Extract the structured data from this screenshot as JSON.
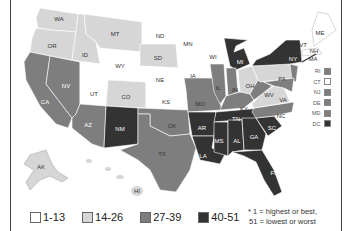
{
  "map": {
    "title": "",
    "colors": {
      "1-13": "#ffffff",
      "14-26": "#d6d6d6",
      "27-39": "#7e7e7e",
      "40-51": "#333333"
    },
    "states": [
      {
        "abbr": "WA",
        "tier": "14-26"
      },
      {
        "abbr": "OR",
        "tier": "14-26"
      },
      {
        "abbr": "CA",
        "tier": "27-39"
      },
      {
        "abbr": "ID",
        "tier": "14-26"
      },
      {
        "abbr": "NV",
        "tier": "27-39"
      },
      {
        "abbr": "MT",
        "tier": "14-26"
      },
      {
        "abbr": "WY",
        "tier": "1-13"
      },
      {
        "abbr": "UT",
        "tier": "1-13"
      },
      {
        "abbr": "AZ",
        "tier": "27-39"
      },
      {
        "abbr": "CO",
        "tier": "14-26"
      },
      {
        "abbr": "NM",
        "tier": "40-51"
      },
      {
        "abbr": "ND",
        "tier": "1-13"
      },
      {
        "abbr": "SD",
        "tier": "14-26"
      },
      {
        "abbr": "NE",
        "tier": "1-13"
      },
      {
        "abbr": "KS",
        "tier": "1-13"
      },
      {
        "abbr": "OK",
        "tier": "27-39"
      },
      {
        "abbr": "TX",
        "tier": "27-39"
      },
      {
        "abbr": "MN",
        "tier": "1-13"
      },
      {
        "abbr": "IA",
        "tier": "1-13"
      },
      {
        "abbr": "MO",
        "tier": "27-39"
      },
      {
        "abbr": "AR",
        "tier": "40-51"
      },
      {
        "abbr": "LA",
        "tier": "40-51"
      },
      {
        "abbr": "WI",
        "tier": "1-13"
      },
      {
        "abbr": "IL",
        "tier": "27-39"
      },
      {
        "abbr": "MI",
        "tier": "40-51"
      },
      {
        "abbr": "IN",
        "tier": "27-39"
      },
      {
        "abbr": "OH",
        "tier": "14-26"
      },
      {
        "abbr": "KY",
        "tier": "27-39"
      },
      {
        "abbr": "TN",
        "tier": "40-51"
      },
      {
        "abbr": "MS",
        "tier": "40-51"
      },
      {
        "abbr": "AL",
        "tier": "40-51"
      },
      {
        "abbr": "GA",
        "tier": "40-51"
      },
      {
        "abbr": "FL",
        "tier": "40-51"
      },
      {
        "abbr": "SC",
        "tier": "40-51"
      },
      {
        "abbr": "NC",
        "tier": "27-39"
      },
      {
        "abbr": "VA",
        "tier": "14-26"
      },
      {
        "abbr": "WV",
        "tier": "27-39"
      },
      {
        "abbr": "PA",
        "tier": "14-26"
      },
      {
        "abbr": "NY",
        "tier": "40-51"
      },
      {
        "abbr": "VT",
        "tier": "1-13"
      },
      {
        "abbr": "NH",
        "tier": "1-13"
      },
      {
        "abbr": "ME",
        "tier": "1-13"
      },
      {
        "abbr": "MA",
        "tier": "1-13"
      },
      {
        "abbr": "AK",
        "tier": "14-26"
      },
      {
        "abbr": "HI",
        "tier": "14-26"
      }
    ],
    "small_states": [
      {
        "abbr": "RI",
        "tier": "27-39"
      },
      {
        "abbr": "CT",
        "tier": "1-13"
      },
      {
        "abbr": "NJ",
        "tier": "27-39"
      },
      {
        "abbr": "DE",
        "tier": "27-39"
      },
      {
        "abbr": "MD",
        "tier": "27-39"
      },
      {
        "abbr": "DC",
        "tier": "40-51"
      }
    ]
  },
  "legend": {
    "items": [
      {
        "label": "1-13",
        "color": "#ffffff"
      },
      {
        "label": "14-26",
        "color": "#d6d6d6"
      },
      {
        "label": "27-39",
        "color": "#7e7e7e"
      },
      {
        "label": "40-51",
        "color": "#333333"
      }
    ],
    "note_line1": "* 1 = highest or best,",
    "note_line2": "51 = lowest or worst"
  }
}
